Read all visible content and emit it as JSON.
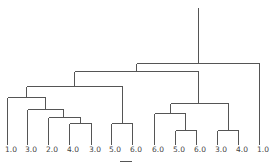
{
  "diagram": {
    "type": "dendrogram",
    "line_color": "#555555",
    "background": "#ffffff",
    "leaves": [
      {
        "label": "1.0",
        "x": 7
      },
      {
        "label": "3.0",
        "x": 27
      },
      {
        "label": "2.0",
        "x": 48
      },
      {
        "label": "4.0",
        "x": 69
      },
      {
        "label": "3.0",
        "x": 91
      },
      {
        "label": "5.0",
        "x": 111
      },
      {
        "label": "6.0",
        "x": 132
      },
      {
        "label": "6.0",
        "x": 154
      },
      {
        "label": "5.0",
        "x": 175
      },
      {
        "label": "6.0",
        "x": 196
      },
      {
        "label": "3.0",
        "x": 217
      },
      {
        "label": "4.0",
        "x": 238
      },
      {
        "label": "1.0",
        "x": 259
      }
    ],
    "leaf_bottom_y": 144,
    "segments": [
      [
        198,
        7,
        198,
        63
      ],
      [
        136,
        63,
        259,
        63
      ],
      [
        259,
        63,
        259,
        144
      ],
      [
        136,
        63,
        136,
        71
      ],
      [
        74,
        71,
        198,
        71
      ],
      [
        74,
        71,
        74,
        86
      ],
      [
        26,
        86,
        122,
        86
      ],
      [
        122,
        86,
        122,
        123
      ],
      [
        111,
        123,
        132,
        123
      ],
      [
        111,
        123,
        111,
        144
      ],
      [
        132,
        123,
        132,
        144
      ],
      [
        26,
        86,
        26,
        97
      ],
      [
        7,
        97,
        45,
        97
      ],
      [
        7,
        97,
        7,
        144
      ],
      [
        45,
        97,
        45,
        109
      ],
      [
        27,
        109,
        63,
        109
      ],
      [
        27,
        109,
        27,
        144
      ],
      [
        63,
        109,
        63,
        117
      ],
      [
        48,
        117,
        80,
        117
      ],
      [
        48,
        117,
        48,
        144
      ],
      [
        80,
        117,
        80,
        123
      ],
      [
        69,
        123,
        91,
        123
      ],
      [
        69,
        123,
        69,
        144
      ],
      [
        91,
        123,
        91,
        144
      ],
      [
        198,
        71,
        198,
        103
      ],
      [
        170,
        103,
        228,
        103
      ],
      [
        170,
        103,
        170,
        113
      ],
      [
        154,
        113,
        185,
        113
      ],
      [
        154,
        113,
        154,
        144
      ],
      [
        185,
        113,
        185,
        130
      ],
      [
        175,
        130,
        196,
        130
      ],
      [
        175,
        130,
        175,
        144
      ],
      [
        196,
        130,
        196,
        144
      ],
      [
        228,
        103,
        228,
        130
      ],
      [
        217,
        130,
        238,
        130
      ],
      [
        217,
        130,
        217,
        144
      ],
      [
        238,
        130,
        238,
        144
      ]
    ]
  }
}
